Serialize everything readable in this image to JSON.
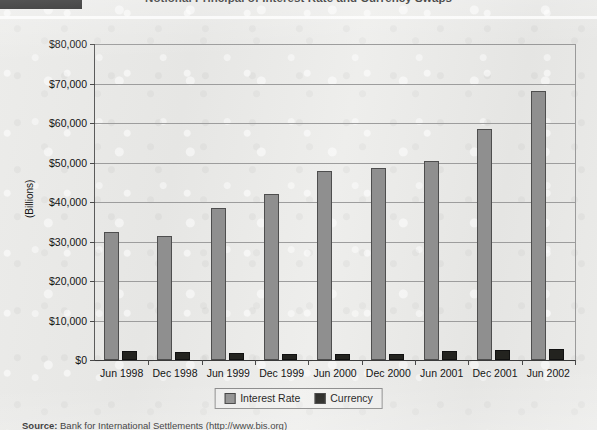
{
  "title": "Notional Principal of Interest Rate and Currency Swaps",
  "source_note": {
    "label": "Source:",
    "text": "Bank for International Settlements",
    "url": "(http://www.bis.org)"
  },
  "legend": {
    "items": [
      {
        "label": "Interest Rate",
        "color": "#8f8f8f"
      },
      {
        "label": "Currency",
        "color": "#23231f"
      }
    ]
  },
  "chart_data": {
    "type": "bar",
    "title": "Notional Principal of Interest Rate and Currency Swaps",
    "xlabel": "",
    "ylabel": "(Billions)",
    "ylim": [
      0,
      80000
    ],
    "ytick_values": [
      0,
      10000,
      20000,
      30000,
      40000,
      50000,
      60000,
      70000,
      80000
    ],
    "ytick_labels": [
      "$0",
      "$10,000",
      "$20,000",
      "$30,000",
      "$40,000",
      "$50,000",
      "$60,000",
      "$70,000",
      "$80,000"
    ],
    "grid": true,
    "legend_position": "bottom",
    "categories": [
      "Jun 1998",
      "Dec 1998",
      "Jun 1999",
      "Dec 1999",
      "Jun 2000",
      "Dec 2000",
      "Jun 2001",
      "Dec 2001",
      "Jun 2002"
    ],
    "series": [
      {
        "name": "Interest Rate",
        "color": "#8f8f8f",
        "values": [
          32400,
          31300,
          38400,
          42100,
          47900,
          48500,
          50500,
          58600,
          68200
        ]
      },
      {
        "name": "Currency",
        "color": "#23231f",
        "values": [
          2200,
          2000,
          1800,
          1400,
          1500,
          1600,
          2200,
          2500,
          2800
        ]
      }
    ]
  }
}
